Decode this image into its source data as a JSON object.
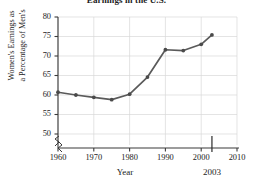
{
  "chart_data": {
    "type": "line",
    "title": "Earnings in the U.S.",
    "xlabel": "Year",
    "ylabel_line1": "Women's Earnings as",
    "ylabel_line2": "a Percentage of Men's",
    "x": [
      1960,
      1965,
      1970,
      1975,
      1980,
      1985,
      1990,
      1995,
      2000,
      2003
    ],
    "values": [
      60.7,
      60.0,
      59.4,
      58.8,
      60.2,
      64.6,
      71.6,
      71.4,
      73.0,
      75.4
    ],
    "series": [
      {
        "name": "Women's earnings as a percentage of men's",
        "values": [
          60.7,
          60.0,
          59.4,
          58.8,
          60.2,
          64.6,
          71.6,
          71.4,
          73.0,
          75.4
        ]
      }
    ],
    "xlim": [
      1958,
      2012
    ],
    "ylim": [
      46,
      80
    ],
    "xticks": [
      1960,
      1970,
      1980,
      1990,
      2000,
      2010
    ],
    "yticks": [
      50,
      55,
      60,
      65,
      70,
      75,
      80
    ],
    "xtick_labels": [
      "1960",
      "1970",
      "1980",
      "1990",
      "2000",
      "2010"
    ],
    "ytick_labels": [
      "50",
      "55",
      "60",
      "65",
      "70",
      "75",
      "80"
    ],
    "grid": true,
    "legend": "none",
    "axis_break_x": true,
    "axis_break_y": true,
    "annotations": [
      {
        "text": "2003",
        "x": 2003,
        "kind": "x-marker"
      }
    ],
    "line_color": "#5a5a5a",
    "marker_color": "#4a4a4a",
    "grid_color": "#d8d8d8",
    "axis_color": "#3a3a3a"
  }
}
